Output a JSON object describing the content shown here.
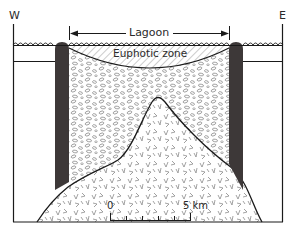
{
  "diagram": {
    "type": "cross-section",
    "orientation": {
      "west_label": "W",
      "east_label": "E"
    },
    "labels": {
      "lagoon": "Lagoon",
      "euphotic_zone": "Euphotic zone"
    },
    "scale_bar": {
      "start_label": "0",
      "end_label": "5 km",
      "ticks": 6
    },
    "colors": {
      "reef": "#3d3838",
      "outline": "#1a1a1a",
      "hatch": "#9a9a9a",
      "sediment_pattern": "#8f8f8f",
      "volcanic_pattern": "#8a8a8a",
      "background": "#ffffff"
    },
    "layers": [
      {
        "name": "water-surface",
        "pattern": "waves"
      },
      {
        "name": "euphotic-zone",
        "pattern": "diagonal-hatch"
      },
      {
        "name": "lagoon-sediment",
        "pattern": "ovals"
      },
      {
        "name": "volcanic-core",
        "pattern": "v-marks"
      },
      {
        "name": "reef-walls",
        "pattern": "solid-dark"
      }
    ]
  }
}
